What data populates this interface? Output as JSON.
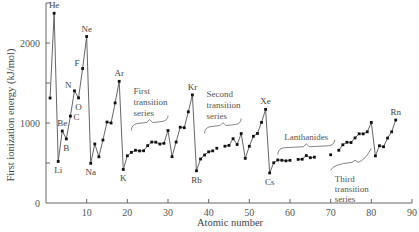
{
  "chart_data": {
    "type": "line",
    "title": "",
    "xlabel": "Atomic number",
    "ylabel": "First ionization energy (kJ/mol)",
    "xlim": [
      0,
      90
    ],
    "ylim": [
      0,
      2500
    ],
    "xticks": [
      10,
      20,
      30,
      40,
      50,
      60,
      70,
      80,
      90
    ],
    "yticks": [
      0,
      500,
      1000,
      1500,
      2000
    ],
    "ytick_labels": {
      "0": "0",
      "1000": "1000",
      "2000": "2000"
    },
    "grid": false,
    "segments": [
      [
        [
          1,
          1312
        ],
        [
          2,
          2372
        ],
        [
          3,
          520
        ],
        [
          4,
          900
        ],
        [
          5,
          801
        ],
        [
          6,
          1086
        ],
        [
          7,
          1402
        ],
        [
          8,
          1314
        ],
        [
          9,
          1681
        ],
        [
          10,
          2081
        ],
        [
          11,
          496
        ],
        [
          12,
          738
        ],
        [
          13,
          578
        ],
        [
          14,
          787
        ],
        [
          15,
          1012
        ],
        [
          16,
          1000
        ],
        [
          17,
          1251
        ],
        [
          18,
          1521
        ],
        [
          19,
          419
        ],
        [
          20,
          590
        ],
        [
          21,
          633
        ],
        [
          22,
          659
        ],
        [
          23,
          651
        ],
        [
          24,
          653
        ],
        [
          25,
          717
        ],
        [
          26,
          762
        ],
        [
          27,
          760
        ],
        [
          28,
          737
        ],
        [
          29,
          746
        ],
        [
          30,
          906
        ],
        [
          31,
          579
        ],
        [
          32,
          762
        ],
        [
          33,
          947
        ],
        [
          34,
          941
        ],
        [
          35,
          1140
        ],
        [
          36,
          1351
        ],
        [
          37,
          403
        ],
        [
          38,
          550
        ],
        [
          39,
          600
        ],
        [
          40,
          640
        ],
        [
          41,
          652
        ]
      ],
      [
        [
          42,
          684
        ]
      ],
      [
        [
          44,
          710
        ],
        [
          45,
          720
        ],
        [
          46,
          804
        ],
        [
          47,
          731
        ],
        [
          48,
          868
        ],
        [
          49,
          558
        ],
        [
          50,
          709
        ],
        [
          51,
          834
        ],
        [
          52,
          869
        ],
        [
          53,
          1008
        ],
        [
          54,
          1170
        ],
        [
          55,
          376
        ],
        [
          56,
          503
        ],
        [
          57,
          538
        ],
        [
          58,
          534
        ],
        [
          59,
          527
        ],
        [
          60,
          533
        ]
      ],
      [
        [
          62,
          545
        ],
        [
          63,
          547
        ],
        [
          64,
          593
        ],
        [
          65,
          566
        ],
        [
          66,
          573
        ]
      ],
      [
        [
          70,
          603
        ]
      ],
      [
        [
          72,
          659
        ],
        [
          73,
          728
        ],
        [
          74,
          759
        ],
        [
          75,
          756
        ],
        [
          76,
          814
        ],
        [
          77,
          865
        ],
        [
          78,
          864
        ],
        [
          79,
          890
        ],
        [
          80,
          1007
        ],
        [
          81,
          589
        ],
        [
          82,
          716
        ],
        [
          83,
          703
        ],
        [
          84,
          812
        ],
        [
          85,
          890
        ],
        [
          86,
          1037
        ]
      ]
    ],
    "element_labels": [
      {
        "z": 2,
        "symbol": "He",
        "pos": "above"
      },
      {
        "z": 3,
        "symbol": "Li",
        "pos": "below"
      },
      {
        "z": 4,
        "symbol": "Be",
        "pos": "above"
      },
      {
        "z": 5,
        "symbol": "B",
        "pos": "below"
      },
      {
        "z": 6,
        "symbol": "C",
        "pos": "right"
      },
      {
        "z": 7,
        "symbol": "N",
        "pos": "left"
      },
      {
        "z": 8,
        "symbol": "O",
        "pos": "below"
      },
      {
        "z": 9,
        "symbol": "F",
        "pos": "left"
      },
      {
        "z": 10,
        "symbol": "Ne",
        "pos": "above"
      },
      {
        "z": 11,
        "symbol": "Na",
        "pos": "below"
      },
      {
        "z": 18,
        "symbol": "Ar",
        "pos": "above"
      },
      {
        "z": 19,
        "symbol": "K",
        "pos": "below"
      },
      {
        "z": 36,
        "symbol": "Kr",
        "pos": "above"
      },
      {
        "z": 37,
        "symbol": "Rb",
        "pos": "below"
      },
      {
        "z": 54,
        "symbol": "Xe",
        "pos": "above"
      },
      {
        "z": 55,
        "symbol": "Cs",
        "pos": "below"
      },
      {
        "z": 86,
        "symbol": "Rn",
        "pos": "above"
      }
    ],
    "annotations": [
      {
        "lines": [
          "First",
          "transition",
          "series"
        ],
        "range": [
          21,
          30
        ]
      },
      {
        "lines": [
          "Second",
          "transition",
          "series"
        ],
        "range": [
          39,
          48
        ]
      },
      {
        "lines": [
          "Lanthanides"
        ],
        "range": [
          57,
          71
        ]
      },
      {
        "lines": [
          "Third",
          "transition",
          "series"
        ],
        "range": [
          72,
          80
        ]
      }
    ]
  }
}
